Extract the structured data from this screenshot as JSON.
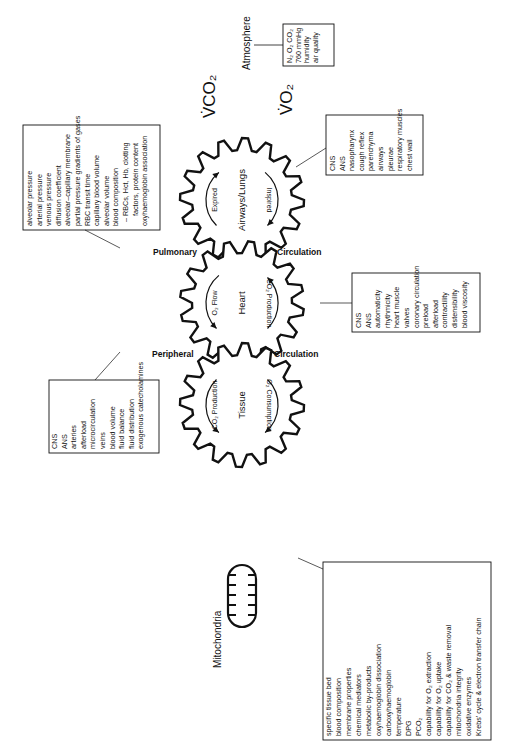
{
  "diagram": {
    "atmosphere": {
      "label": "Atmosphere",
      "items": [
        "N₂ O₂ CO₂",
        "760 mmHg",
        "humidity",
        "air quality"
      ]
    },
    "vco2_label": "V̇CO₂",
    "vo2_label": "V̇O₂",
    "gears": {
      "lungs": {
        "label": "Airways/Lungs",
        "arrow_left": "Expired",
        "arrow_right": "Inspired"
      },
      "heart": {
        "label": "Heart",
        "arrow_left": "O₂ Flow",
        "arrow_right": "CO₂ Production"
      },
      "tissue": {
        "label": "Tissue",
        "arrow_left": "CO₂ Production",
        "arrow_right": "O₂ Consumption"
      }
    },
    "circulation_labels": {
      "pulmonary_left": "Pulmonary",
      "pulmonary_right": "Circulation",
      "peripheral_left": "Peripheral",
      "peripheral_right": "Circulation"
    },
    "mitochondria_label": "Mitochondria",
    "boxes": {
      "pulmonary": [
        "alveolar pressure",
        "arterial pressure",
        "venous pressure",
        "diffusion coefficient",
        "alveolar–capillary membrane",
        "partial pressure gradients of gases",
        "RBC transit time",
        "capillary blood volume",
        "alveolar volume",
        "blood composition",
        "  – RBCs, Hct, Hb, clotting",
        "     factors, protein content",
        "oxyhaemoglobin association"
      ],
      "airways": [
        "CNS",
        "ANS",
        "nasopharynx",
        "cough reflex",
        "parenchyma",
        "airways",
        "pleurae",
        "respiratory muscles",
        "chest wall"
      ],
      "heart": [
        "CNS",
        "ANS",
        "automaticity",
        "rhythmicity",
        "heart muscle",
        "valves",
        "coronary circulation",
        "preload",
        "afterload",
        "contractility",
        "distensibility",
        "blood viscosity"
      ],
      "peripheral": [
        "CNS",
        "ANS",
        "arteries",
        "afterload",
        "microcirculation",
        "veins",
        "blood volume",
        "fluid balance",
        "fluid distribution",
        "exogenous catecholamines"
      ],
      "tissue": [
        "specific tissue bed",
        "blood composition",
        "membrane properties",
        "chemical mediators",
        "metabolic by-products",
        "oxyhaemoglobin dissociation",
        "carboxyhaemoglobin",
        "temperature",
        "DPG",
        "PCO₂",
        "capability for O₂ extraction",
        "capability for O₂ uptake",
        "capability for CO₂ & waste removal",
        "mitochondria integrity",
        "oxidative enzymes",
        "Krebs' cycle & electron transfer chain"
      ]
    }
  }
}
